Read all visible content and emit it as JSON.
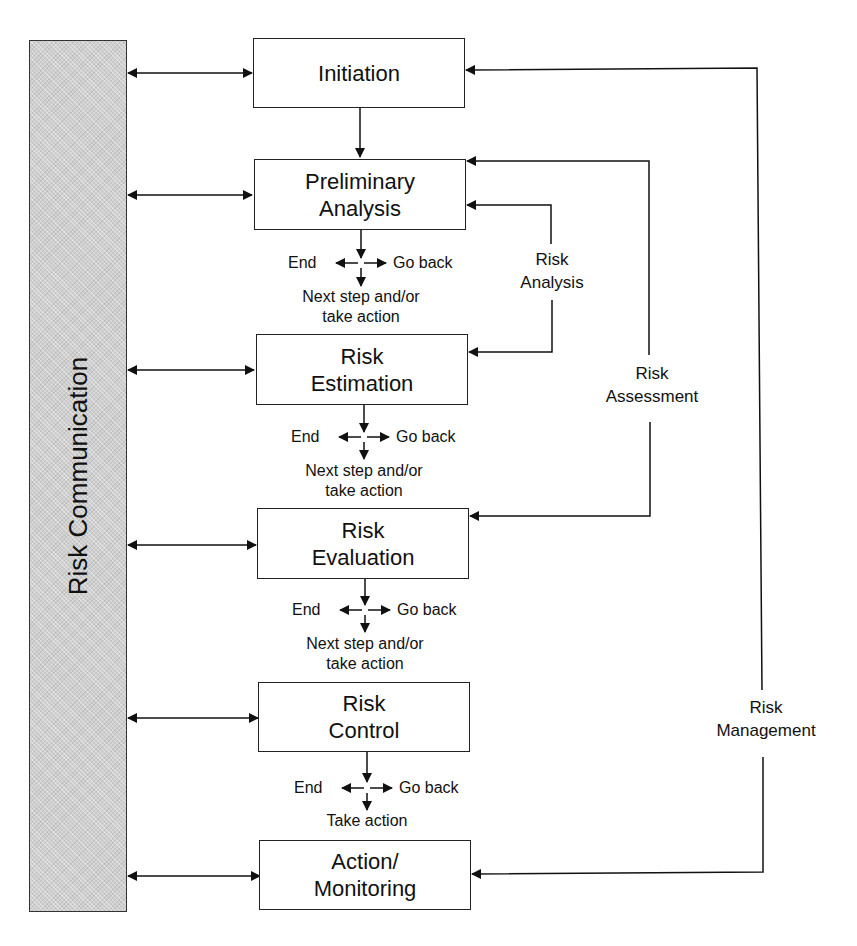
{
  "side_panel": {
    "label": "Risk Communication",
    "fill": "#cfcfcf"
  },
  "steps": [
    {
      "id": "initiation",
      "lines": [
        "Initiation"
      ]
    },
    {
      "id": "preliminary-analysis",
      "lines": [
        "Preliminary",
        "Analysis"
      ]
    },
    {
      "id": "risk-estimation",
      "lines": [
        "Risk",
        "Estimation"
      ]
    },
    {
      "id": "risk-evaluation",
      "lines": [
        "Risk",
        "Evaluation"
      ]
    },
    {
      "id": "risk-control",
      "lines": [
        "Risk",
        "Control"
      ]
    },
    {
      "id": "action-monitoring",
      "lines": [
        "Action/",
        "Monitoring"
      ]
    }
  ],
  "decisions": [
    {
      "end": "End",
      "go_back": "Go back",
      "next": [
        "Next step and/or",
        "take action"
      ]
    },
    {
      "end": "End",
      "go_back": "Go back",
      "next": [
        "Next step and/or",
        "take action"
      ]
    },
    {
      "end": "End",
      "go_back": "Go back",
      "next": [
        "Next step and/or",
        "take action"
      ]
    },
    {
      "end": "End",
      "go_back": "Go back",
      "next": [
        "Take action"
      ]
    }
  ],
  "loops": [
    {
      "lines": [
        "Risk",
        "Analysis"
      ]
    },
    {
      "lines": [
        "Risk",
        "Assessment"
      ]
    },
    {
      "lines": [
        "Risk",
        "Management"
      ]
    }
  ]
}
